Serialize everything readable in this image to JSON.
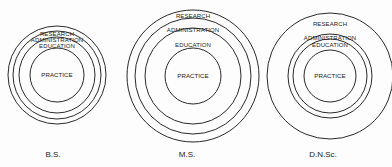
{
  "diagrams": [
    {
      "degree": "B.S.",
      "center": [
        57,
        75
      ],
      "rings": [
        {
          "label": "RESEARCH",
          "r": 49,
          "label_y": 34
        },
        {
          "label": "ADMINISTRATION",
          "r": 44,
          "label_y": 40
        },
        {
          "label": "EDUCATION",
          "r": 38,
          "label_y": 46
        },
        {
          "label": "PRACTICE",
          "r": 27,
          "core": true
        }
      ],
      "label_x": 53
    },
    {
      "degree": "M.S.",
      "center": [
        193,
        76
      ],
      "rings": [
        {
          "label": "RESEARCH",
          "r": 66,
          "label_y": 16
        },
        {
          "label": "ADMINISTRATION",
          "r": 58,
          "label_y": 30
        },
        {
          "label": "EDUCATION",
          "r": 48,
          "label_y": 45
        },
        {
          "label": "PRACTICE",
          "r": 28,
          "core": true
        }
      ],
      "label_x": 187
    },
    {
      "degree": "D.N.Sc.",
      "center": [
        330,
        76
      ],
      "rings": [
        {
          "label": "RESEARCH",
          "r": 63,
          "label_y": 24
        },
        {
          "label": "ADMINISTRATION",
          "r": 42,
          "label_y": 38
        },
        {
          "label": "EDUCATION",
          "r": 37,
          "label_y": 45
        },
        {
          "label": "PRACTICE",
          "r": 26,
          "core": true
        }
      ],
      "label_x": 323
    }
  ]
}
